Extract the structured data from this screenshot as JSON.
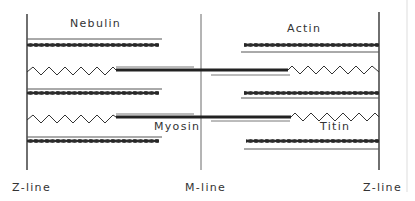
{
  "diagram": {
    "type": "sarcomere-structure",
    "labels": {
      "nebulin": "Nebulin",
      "actin": "Actin",
      "myosin": "Myosin",
      "titin": "Titin",
      "z_line_left": "Z-line",
      "m_line": "M-line",
      "z_line_right": "Z-line"
    },
    "colors": {
      "line": "#222222",
      "thin_line": "#555555",
      "faint_border": "#cccccc"
    }
  }
}
